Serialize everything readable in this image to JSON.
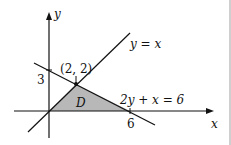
{
  "figure": {
    "axis_x_label": "x",
    "axis_y_label": "y",
    "line1_label": "y = x",
    "line2_label": "2y + x = 6",
    "point_label": "(2, 2)",
    "y_intercept_label": "3",
    "x_intercept_label": "6",
    "region_label": "D",
    "region_fill": "#b8b8b8",
    "line_color": "#111111"
  }
}
